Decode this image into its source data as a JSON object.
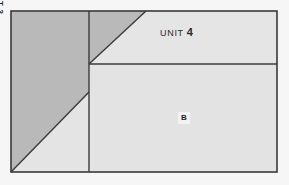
{
  "drawing": {
    "kind": "site-plan",
    "title": "Unit Site Plan",
    "colors": {
      "page_background": "#f6f6f6",
      "unit3_fill": "#b9b9b9",
      "unit4_fill": "#e4e4e4",
      "parcel_b_fill": "#e3e3e3",
      "line": "#3a3a3a",
      "label_text": "#242424",
      "label_halo": "#f3f3f3"
    },
    "bounds": {
      "left": 11,
      "top": 11,
      "right": 277,
      "bottom": 172
    },
    "geometry": {
      "vertical_divider_x": 89,
      "horizontal_divider_y": 64,
      "upper_diagonal": {
        "x1": 89,
        "y1": 64,
        "x2": 146,
        "y2": 11
      },
      "lower_diagonal": {
        "x1": 11,
        "y1": 172,
        "x2": 89,
        "y2": 92
      }
    },
    "regions": [
      {
        "id": "unit-3",
        "label": "UNIT 3",
        "shade": "dark",
        "orientation": "vertical",
        "points": "11,11 146,11 89,64 89,92 11,172"
      },
      {
        "id": "unit-4",
        "label": "UNIT 4",
        "shade": "light",
        "orientation": "horizontal",
        "points": "146,11 277,11 277,64 89,64"
      },
      {
        "id": "parcel-b",
        "label": "B",
        "shade": "light",
        "orientation": "horizontal",
        "points": "89,64 277,64 277,172 89,172"
      },
      {
        "id": "unit-3-lower-remainder",
        "label": "",
        "shade": "light",
        "orientation": "horizontal",
        "points": "89,92 89,172 11,172"
      }
    ],
    "labels": {
      "unit3": {
        "text": "UNIT 3",
        "x": 47,
        "y": 74,
        "rotation_deg": 90
      },
      "unit4": {
        "prefix": "UNIT",
        "number": "4",
        "x": 160,
        "y": 27,
        "rotation_deg": 0
      },
      "parcel_b": {
        "text": "B",
        "x": 184,
        "y": 118,
        "rotation_deg": 0
      }
    }
  }
}
